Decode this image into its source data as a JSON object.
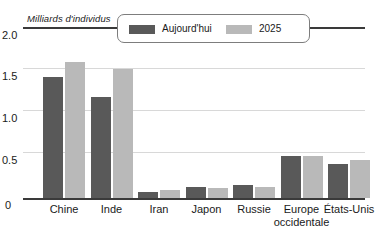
{
  "chart_data": {
    "type": "bar",
    "title": "",
    "subtitle": "",
    "xlabel": "",
    "ylabel": "Milliards d'individus",
    "ylim": [
      0,
      2.0
    ],
    "yticks": [
      "0",
      "0.5",
      "1.0",
      "1.5",
      "2.0"
    ],
    "grid": true,
    "legend_position": "top-center",
    "categories": [
      "Chine",
      "Inde",
      "Iran",
      "Japon",
      "Russie",
      "Europe occidentale",
      "États-Unis"
    ],
    "category_lines": [
      [
        "Chine",
        ""
      ],
      [
        "Inde",
        ""
      ],
      [
        "Iran",
        ""
      ],
      [
        "Japon",
        ""
      ],
      [
        "Russie",
        ""
      ],
      [
        "Europe",
        "occidentale"
      ],
      [
        "États-Unis",
        ""
      ]
    ],
    "series": [
      {
        "name": "Aujourd'hui",
        "color": "#595959",
        "values": [
          1.4,
          1.17,
          0.07,
          0.13,
          0.15,
          0.48,
          0.39
        ]
      },
      {
        "name": "2025",
        "color": "#b9b9b9",
        "values": [
          1.57,
          1.49,
          0.09,
          0.12,
          0.13,
          0.49,
          0.44
        ]
      }
    ]
  },
  "legend": {
    "entries": [
      {
        "label": "Aujourd'hui",
        "swatch": "dark-swatch"
      },
      {
        "label": "2025",
        "swatch": "light-swatch"
      }
    ]
  },
  "axis": {
    "unit_label": "Milliards d'individus",
    "ticks": {
      "t2_0": "2.0",
      "t1_5": "1.5",
      "t1_0": "1.0",
      "t0_5": "0.5",
      "t0": "0"
    }
  },
  "colors": {
    "series_today": "#595959",
    "series_2025": "#b9b9b9",
    "axis_line": "#3a3a3a",
    "gridline": "#d8d8d8",
    "background": "#ffffff"
  }
}
